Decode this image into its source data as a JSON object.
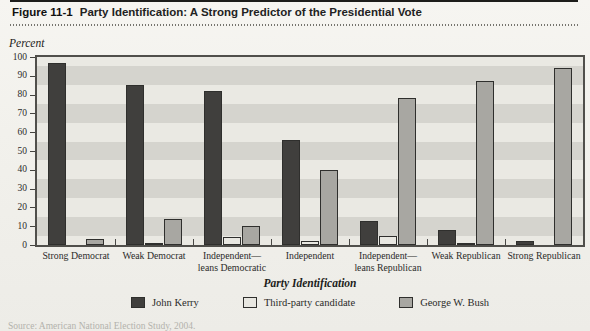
{
  "figure": {
    "label": "Figure 11-1",
    "title": "Party Identification: A Strong Predictor of the Presidential Vote"
  },
  "chart_data": {
    "type": "bar",
    "title": "Party Identification: A Strong Predictor of the Presidential Vote",
    "ylabel": "Percent",
    "xlabel": "Party Identification",
    "ylim": [
      0,
      100
    ],
    "yticks": [
      0,
      10,
      20,
      30,
      40,
      50,
      60,
      70,
      80,
      90,
      100
    ],
    "grid": "alternating horizontal bands, 10-unit",
    "legend_position": "bottom",
    "categories": [
      "Strong Democrat",
      "Weak Democrat",
      "Independent—\nleans Democratic",
      "Independent",
      "Independent—\nleans Republican",
      "Weak Republican",
      "Strong Republican"
    ],
    "series": [
      {
        "name": "John Kerry",
        "color": "#403f3d",
        "values": [
          97,
          85,
          82,
          56,
          13,
          8,
          2
        ]
      },
      {
        "name": "Third-party candidate",
        "color": "#e8e7e1",
        "values": [
          0,
          1,
          4,
          2,
          5,
          1,
          0
        ]
      },
      {
        "name": "George W. Bush",
        "color": "#a8a7a2",
        "values": [
          3,
          14,
          10,
          40,
          78,
          87,
          94
        ]
      }
    ]
  },
  "source_note": "Source: American National Election Study, 2004.",
  "colors": {
    "band_light": "#eae9e3",
    "band_dark": "#d5d4ce",
    "plot_border": "#504f4b",
    "bar_outline": "#2f2f2d",
    "top_rule": "#1d1d1b"
  }
}
